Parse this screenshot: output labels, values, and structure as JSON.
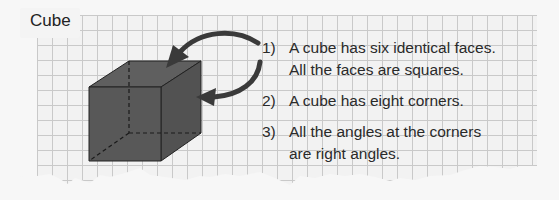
{
  "title": "Cube",
  "facts": [
    {
      "num": "1)",
      "line1": "A cube has six identical faces.",
      "line2": "All the faces are squares."
    },
    {
      "num": "2)",
      "line1": "A cube has eight corners.",
      "line2": ""
    },
    {
      "num": "3)",
      "line1": "All the angles at the corners",
      "line2": "are right angles."
    }
  ],
  "colors": {
    "cube_face": "#585858",
    "cube_edge": "#222222",
    "arrow": "#3a3a3a",
    "grid_line": "#c9c9c9",
    "paper": "#f2f2f2"
  }
}
